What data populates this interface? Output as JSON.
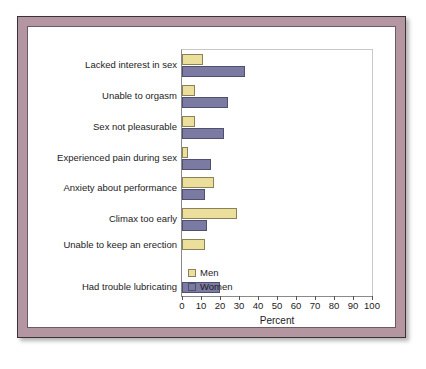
{
  "chart_data": {
    "type": "bar",
    "orientation": "horizontal",
    "title": "",
    "xlabel": "Percent",
    "ylabel": "",
    "xlim": [
      0,
      100
    ],
    "xticks": [
      0,
      10,
      20,
      30,
      40,
      50,
      60,
      70,
      80,
      90,
      100
    ],
    "xtick_labels": [
      "0",
      "10",
      "20",
      "30",
      "40",
      "50",
      "60",
      "70",
      "80",
      "90",
      "100"
    ],
    "grid": false,
    "legend_position": "lower right",
    "categories": [
      "Lacked interest in sex",
      "Unable to orgasm",
      "Sex not pleasurable",
      "Experienced pain during sex",
      "Anxiety about performance",
      "Climax too early",
      "Unable to keep an erection",
      "Had trouble lubricating"
    ],
    "series": [
      {
        "name": "Men",
        "color": "#ecdf9b",
        "values": [
          11,
          7,
          7,
          3,
          17,
          29,
          12,
          null
        ]
      },
      {
        "name": "Women",
        "color": "#7a7aa3",
        "values": [
          33,
          24,
          22,
          15,
          12,
          13,
          null,
          20
        ]
      }
    ]
  },
  "legend": {
    "entries": [
      {
        "label": "Men",
        "swatch": "men-swatch",
        "color": "#ecdf9b"
      },
      {
        "label": "Women",
        "swatch": "women-swatch",
        "color": "#7a7aa3"
      }
    ]
  },
  "frame": {
    "border_color": "#b396a0",
    "outline_color": "#3b3138",
    "plot_background": "#ffffff"
  }
}
